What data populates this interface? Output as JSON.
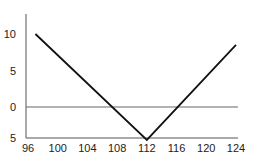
{
  "chart_data": {
    "type": "line",
    "title": "",
    "xlabel": "",
    "ylabel": "",
    "x_ticks": [
      "96",
      "100",
      "104",
      "108",
      "112",
      "116",
      "120",
      "124"
    ],
    "y_ticks": [
      "10",
      "5",
      "0",
      "5"
    ],
    "xlim": [
      96,
      124
    ],
    "ylim": [
      -5,
      13
    ],
    "grid": false,
    "legend": null,
    "series": [
      {
        "name": "payoff",
        "x": [
          97,
          112,
          124
        ],
        "y": [
          10,
          -4.5,
          8.5
        ]
      }
    ],
    "reference_lines": [
      {
        "type": "horizontal",
        "y": 0
      }
    ]
  }
}
